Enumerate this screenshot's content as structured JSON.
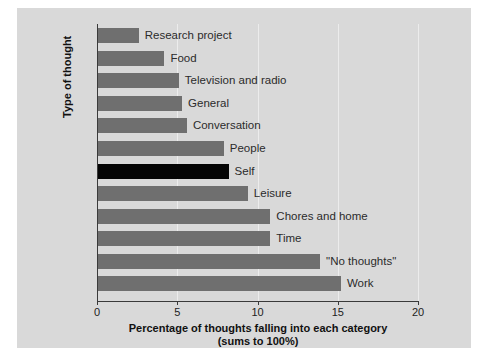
{
  "chart_data": {
    "type": "bar",
    "orientation": "horizontal",
    "title": "",
    "xlabel": "Percentage of thoughts falling into each category",
    "xlabel_line2": "(sums to 100%)",
    "ylabel": "Type of thought",
    "xlim": [
      0,
      20
    ],
    "xticks": [
      0,
      5,
      10,
      15,
      20
    ],
    "xtick_labels": [
      "0",
      "5",
      "10",
      "15",
      "20"
    ],
    "grid": true,
    "grid_axis": "x",
    "legend": "none",
    "bar_color": "#6f6f6f",
    "highlight_color": "#050505",
    "highlight_category": "Self",
    "categories": [
      "Research project",
      "Food",
      "Television and radio",
      "General",
      "Conversation",
      "People",
      "Self",
      "Leisure",
      "Chores and home",
      "Time",
      "\"No thoughts\"",
      "Work"
    ],
    "values": [
      2.6,
      4.2,
      5.1,
      5.3,
      5.6,
      7.9,
      8.2,
      9.4,
      10.8,
      10.8,
      13.9,
      15.2
    ],
    "bars": [
      {
        "label": "Research project",
        "value": 2.6,
        "highlight": false
      },
      {
        "label": "Food",
        "value": 4.2,
        "highlight": false
      },
      {
        "label": "Television and radio",
        "value": 5.1,
        "highlight": false
      },
      {
        "label": "General",
        "value": 5.3,
        "highlight": false
      },
      {
        "label": "Conversation",
        "value": 5.6,
        "highlight": false
      },
      {
        "label": "People",
        "value": 7.9,
        "highlight": false
      },
      {
        "label": "Self",
        "value": 8.2,
        "highlight": true
      },
      {
        "label": "Leisure",
        "value": 9.4,
        "highlight": false
      },
      {
        "label": "Chores and home",
        "value": 10.8,
        "highlight": false
      },
      {
        "label": "Time",
        "value": 10.8,
        "highlight": false
      },
      {
        "label": "\"No thoughts\"",
        "value": 13.9,
        "highlight": false
      },
      {
        "label": "Work",
        "value": 15.2,
        "highlight": false
      }
    ]
  }
}
